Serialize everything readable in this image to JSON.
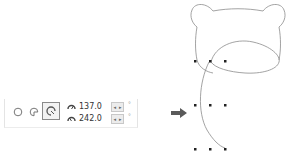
{
  "toolbar": {
    "modes": [
      {
        "name": "ellipse",
        "active": false
      },
      {
        "name": "pie",
        "active": false
      },
      {
        "name": "arc",
        "active": true
      }
    ],
    "start_angle": {
      "icon": "start-angle-icon",
      "value": "137.0",
      "unit": "°"
    },
    "end_angle": {
      "icon": "end-angle-icon",
      "value": "242.0",
      "unit": "°"
    }
  },
  "arrow": {
    "icon": "right-arrow-icon",
    "color": "#555555"
  },
  "canvas": {
    "shape": "bear-head-outline",
    "ellipse_arc": {
      "start_angle": 137.0,
      "end_angle": 242.0
    },
    "stroke_color": "#888888",
    "handle_color": "#222222"
  }
}
